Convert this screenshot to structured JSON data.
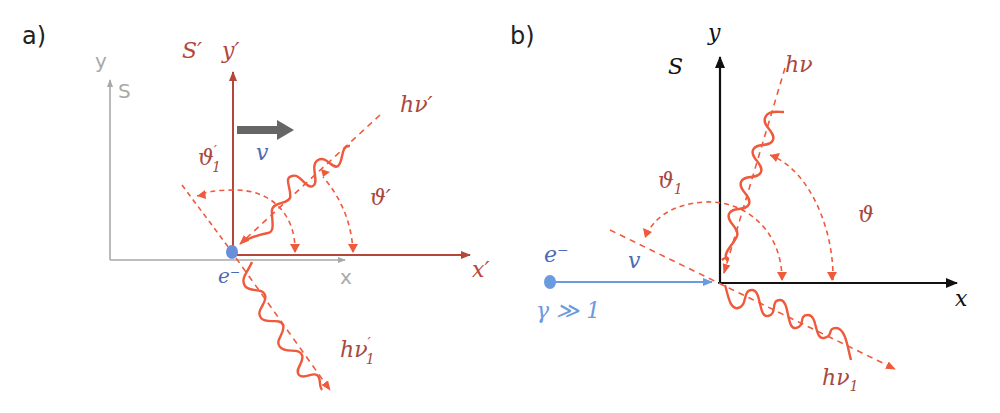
{
  "colors": {
    "red_axis": "#b5463b",
    "photon": "#ef5a3c",
    "label_red": "#a8483e",
    "gray_axis": "#a9a9a9",
    "gray_arrow": "#666666",
    "blue": "#4a6bb5",
    "light_blue": "#6a9ae0",
    "black": "#111111"
  },
  "panel_a": {
    "label": "a)",
    "lab_frame": {
      "name": "S",
      "x_axis": "x",
      "y_axis": "y"
    },
    "rest_frame": {
      "name": "S′",
      "x_axis": "x′",
      "y_axis": "y′"
    },
    "velocity": "v",
    "electron": "e⁻",
    "incident_photon": "hν′",
    "scattered_photon_h": "hν",
    "scattered_photon_sup": "′",
    "scattered_photon_sub": "1",
    "angle_incident": "ϑ′",
    "angle_scattered_main": "ϑ",
    "angle_scattered_sup": "′",
    "angle_scattered_sub": "1"
  },
  "panel_b": {
    "label": "b)",
    "frame": {
      "name": "S",
      "x_axis": "x",
      "y_axis": "y"
    },
    "electron": "e⁻",
    "velocity": "v",
    "gamma_condition": "γ ≫ 1",
    "incident_photon": "hν",
    "scattered_photon_h": "hν",
    "scattered_photon_sub": "1",
    "angle_incident": "ϑ",
    "angle_scattered_main": "ϑ",
    "angle_scattered_sub": "1"
  }
}
